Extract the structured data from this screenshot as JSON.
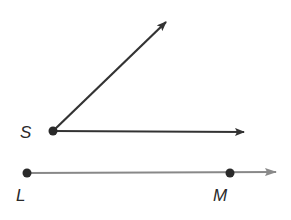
{
  "figure": {
    "angle": {
      "vertex_label": "S",
      "vertex": [
        53,
        131
      ],
      "ray_up_tip": [
        168,
        20
      ],
      "ray_right_tip": [
        246,
        132
      ],
      "color": "#333333"
    },
    "ray_lm": {
      "point_l_label": "L",
      "point_m_label": "M",
      "point_l": [
        27,
        173
      ],
      "point_m": [
        230,
        173
      ],
      "tip": [
        277,
        172
      ],
      "color": "#7a7a7a"
    }
  }
}
